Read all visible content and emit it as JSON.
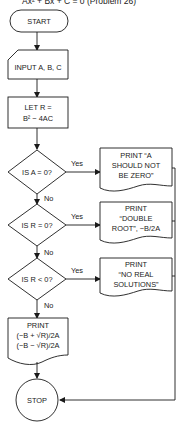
{
  "title": "Ax² + Bx + C = 0 (Problem 26)",
  "nodes": {
    "start": "START",
    "input": "INPUT A, B, C",
    "let": [
      "LET R =",
      "B² − 4AC"
    ],
    "decision1": "IS A = 0?",
    "decision2": "IS R = 0?",
    "decision3": "IS R < 0?",
    "print1": [
      "PRINT “A",
      "SHOULD NOT",
      "BE ZERO”"
    ],
    "print2": [
      "PRINT",
      "“DOUBLE",
      "ROOT”, −B/2A"
    ],
    "print3": [
      "PRINT",
      "“NO REAL",
      "SOLUTIONS”"
    ],
    "print4": [
      "PRINT",
      "(−B + √R)/2A",
      "(−B − √R)/2A"
    ],
    "stop": "STOP"
  },
  "labels": {
    "yes": "Yes",
    "no": "No"
  },
  "colors": {
    "stroke": "#1a1a1a",
    "background": "#ffffff"
  }
}
